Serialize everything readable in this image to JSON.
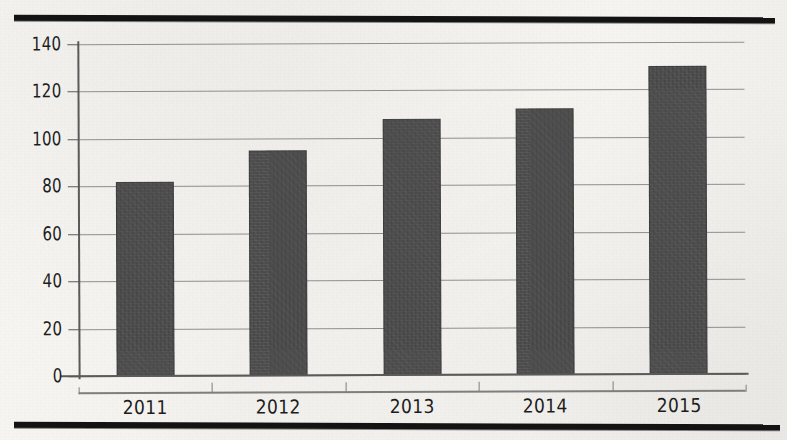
{
  "chart_data": {
    "type": "bar",
    "title": "",
    "subtitle": "",
    "xlabel": "",
    "ylabel": "",
    "categories": [
      "2011",
      "2012",
      "2013",
      "2014",
      "2015"
    ],
    "values": [
      82,
      95,
      108,
      112,
      130
    ],
    "ylim": [
      0,
      140
    ],
    "yticks": [
      0,
      20,
      40,
      60,
      80,
      100,
      120,
      140
    ],
    "ytick_labels": [
      "0",
      "20",
      "40",
      "60",
      "80",
      "100",
      "120",
      "140"
    ],
    "grid": true,
    "grid_axis": "y",
    "legend": false,
    "legend_position": "none",
    "bar_color": "#4d4d4d",
    "gridline_color": "#8f8f8f",
    "axis_color": "#5a5a5a",
    "text_color": "#1c1c1c",
    "background_color": "#f4f3ef",
    "annotations": []
  },
  "decoration": {
    "rule_color": "#131313",
    "top_rule_name": "top-rule",
    "bottom_rule_name": "bottom-rule"
  }
}
